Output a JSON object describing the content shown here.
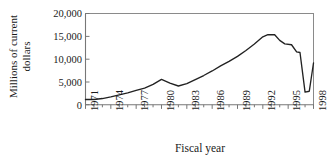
{
  "chart_data": {
    "type": "line",
    "title": "",
    "xlabel": "Fiscal year",
    "ylabel": "Millions of current dollars",
    "ylabel_line1": "Millions of current",
    "ylabel_line2": "dollars",
    "xlim": [
      1971,
      1998
    ],
    "ylim": [
      0,
      20000
    ],
    "yticks": [
      0,
      5000,
      10000,
      15000,
      20000
    ],
    "ytick_labels": [
      "0",
      "5,000",
      "10,000",
      "15,000",
      "20,000"
    ],
    "xticks": [
      1971,
      1974,
      1977,
      1980,
      1983,
      1986,
      1989,
      1992,
      1995,
      1998
    ],
    "xtick_labels": [
      "1971",
      "1974",
      "1977",
      "1980",
      "1983",
      "1986",
      "1989",
      "1992",
      "1995",
      "1998"
    ],
    "x_minor_tick_step": 1,
    "grid": false,
    "legend": "none",
    "line_color": "#222222",
    "axis_color": "#6e6e6e",
    "background_color": "#ffffff",
    "x": [
      1971,
      1972,
      1973,
      1974,
      1975,
      1976,
      1977,
      1978,
      1979,
      1980,
      1981,
      1982,
      1983,
      1984,
      1985,
      1986,
      1987,
      1988,
      1989,
      1990,
      1991,
      1992,
      1993,
      1994,
      1995,
      1996,
      1997,
      1998
    ],
    "values": [
      1100,
      1150,
      1300,
      1600,
      2000,
      2500,
      3100,
      3600,
      4400,
      5500,
      4800,
      4100,
      4500,
      5400,
      6300,
      7300,
      8400,
      9400,
      10500,
      11800,
      13200,
      14800,
      15300,
      15300,
      14000,
      13300,
      13100,
      11500
    ],
    "series": [
      {
        "name": "Millions of current dollars",
        "x": [
          1971,
          1972,
          1973,
          1974,
          1975,
          1976,
          1977,
          1978,
          1979,
          1980,
          1981,
          1982,
          1983,
          1984,
          1985,
          1986,
          1987,
          1988,
          1989,
          1990,
          1991,
          1992,
          1993,
          1994,
          1995,
          1996,
          1997,
          1998
        ],
        "values": [
          1100,
          1150,
          1300,
          1600,
          2000,
          2500,
          3100,
          3600,
          4400,
          5500,
          4800,
          4100,
          4500,
          5400,
          6300,
          7300,
          8400,
          9400,
          10500,
          11800,
          13200,
          14800,
          15300,
          15300,
          14000,
          13300,
          13100,
          11500
        ]
      }
    ]
  },
  "polyline": {
    "points": [
      {
        "x": 1971.0,
        "y": 1150
      },
      {
        "x": 1972.0,
        "y": 1150
      },
      {
        "x": 1973.0,
        "y": 1350
      },
      {
        "x": 1974.0,
        "y": 1700
      },
      {
        "x": 1975.0,
        "y": 2150
      },
      {
        "x": 1976.0,
        "y": 2600
      },
      {
        "x": 1977.0,
        "y": 3150
      },
      {
        "x": 1978.0,
        "y": 3650
      },
      {
        "x": 1979.0,
        "y": 4450
      },
      {
        "x": 1980.0,
        "y": 5550
      },
      {
        "x": 1981.0,
        "y": 4750
      },
      {
        "x": 1982.0,
        "y": 4100
      },
      {
        "x": 1983.0,
        "y": 4600
      },
      {
        "x": 1984.0,
        "y": 5500
      },
      {
        "x": 1985.0,
        "y": 6400
      },
      {
        "x": 1986.0,
        "y": 7400
      },
      {
        "x": 1987.0,
        "y": 8500
      },
      {
        "x": 1988.0,
        "y": 9500
      },
      {
        "x": 1989.0,
        "y": 10600
      },
      {
        "x": 1990.0,
        "y": 11900
      },
      {
        "x": 1991.0,
        "y": 13300
      },
      {
        "x": 1992.0,
        "y": 14900
      },
      {
        "x": 1992.6,
        "y": 15350
      },
      {
        "x": 1993.4,
        "y": 15350
      },
      {
        "x": 1994.0,
        "y": 14100
      },
      {
        "x": 1994.6,
        "y": 13350
      },
      {
        "x": 1995.4,
        "y": 13150
      },
      {
        "x": 1996.0,
        "y": 11600
      },
      {
        "x": 1996.4,
        "y": 11450
      },
      {
        "x": 1997.0,
        "y": 2750
      },
      {
        "x": 1997.5,
        "y": 2950
      },
      {
        "x": 1998.0,
        "y": 9150
      }
    ]
  }
}
